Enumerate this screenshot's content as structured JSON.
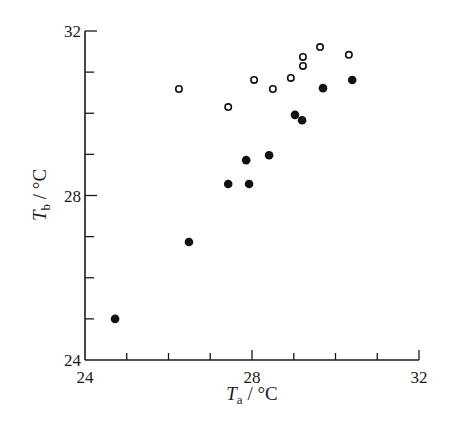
{
  "chart_data": {
    "type": "scatter",
    "title": "",
    "xlabel": "Ta / °C",
    "ylabel": "Tb / °C",
    "xlabel_parts": {
      "symbol": "T",
      "subscript": "a",
      "unit": " / °C"
    },
    "ylabel_parts": {
      "symbol": "T",
      "subscript": "b",
      "unit": " / °C"
    },
    "xlim": [
      24,
      32
    ],
    "ylim": [
      24,
      32
    ],
    "x_major_ticks": [
      24,
      28,
      32
    ],
    "y_major_ticks": [
      24,
      28,
      32
    ],
    "x_minor_step": 1,
    "y_minor_step": 1,
    "x_tick_labels": [
      "24",
      "28",
      "32"
    ],
    "y_tick_labels": [
      "24",
      "28",
      "32"
    ],
    "grid": false,
    "legend": null,
    "series": [
      {
        "name": "open circles",
        "marker": "open-circle",
        "points": [
          [
            26.25,
            30.59
          ],
          [
            27.43,
            30.15
          ],
          [
            28.05,
            30.81
          ],
          [
            28.5,
            30.59
          ],
          [
            28.93,
            30.86
          ],
          [
            29.22,
            31.15
          ],
          [
            29.22,
            31.37
          ],
          [
            29.63,
            31.61
          ],
          [
            30.32,
            31.42
          ]
        ]
      },
      {
        "name": "filled circles",
        "marker": "filled-circle",
        "points": [
          [
            24.72,
            25.0
          ],
          [
            26.49,
            26.87
          ],
          [
            27.43,
            28.28
          ],
          [
            27.93,
            28.28
          ],
          [
            27.86,
            28.86
          ],
          [
            28.41,
            28.98
          ],
          [
            29.03,
            29.96
          ],
          [
            29.2,
            29.83
          ],
          [
            29.7,
            30.61
          ],
          [
            30.4,
            30.81
          ]
        ]
      }
    ],
    "colors": {
      "axis": "#1a1a1a",
      "marker": "#111111",
      "background": "#ffffff"
    }
  }
}
